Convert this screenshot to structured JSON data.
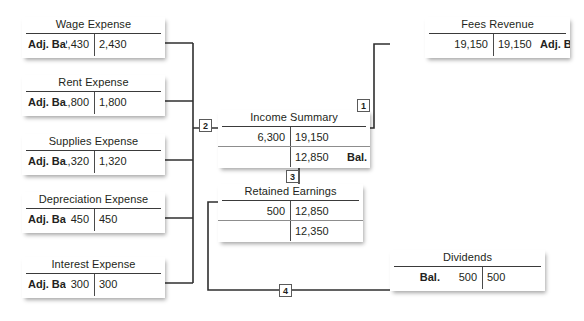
{
  "diagram": {
    "line_color": "#333333",
    "card_bg": "#ffffff"
  },
  "accounts": [
    {
      "key": "wage_expense",
      "name": "Wage Expense",
      "rows": [
        {
          "label_left": "Adj. Bal.",
          "debit": "2,430",
          "credit": "2,430",
          "label_right": ""
        }
      ]
    },
    {
      "key": "rent_expense",
      "name": "Rent Expense",
      "rows": [
        {
          "label_left": "Adj. Bal.",
          "debit": "1,800",
          "credit": "1,800",
          "label_right": ""
        }
      ]
    },
    {
      "key": "supplies_expense",
      "name": "Supplies Expense",
      "rows": [
        {
          "label_left": "Adj. Bal.",
          "debit": "1,320",
          "credit": "1,320",
          "label_right": ""
        }
      ]
    },
    {
      "key": "depreciation_expense",
      "name": "Depreciation Expense",
      "rows": [
        {
          "label_left": "Adj. Bal.",
          "debit": "450",
          "credit": "450",
          "label_right": ""
        }
      ]
    },
    {
      "key": "interest_expense",
      "name": "Interest Expense",
      "rows": [
        {
          "label_left": "Adj. Bal.",
          "debit": "300",
          "credit": "300",
          "label_right": ""
        }
      ]
    },
    {
      "key": "fees_revenue",
      "name": "Fees Revenue",
      "rows": [
        {
          "label_left": "",
          "debit": "19,150",
          "credit": "19,150",
          "label_right": "Adj. Bal."
        }
      ]
    },
    {
      "key": "income_summary",
      "name": "Income Summary",
      "rows": [
        {
          "label_left": "",
          "debit": "6,300",
          "credit": "19,150",
          "label_right": ""
        },
        {
          "label_left": "",
          "debit": "",
          "credit": "12,850",
          "label_right": "Bal."
        }
      ]
    },
    {
      "key": "retained_earnings",
      "name": "Retained Earnings",
      "rows": [
        {
          "label_left": "",
          "debit": "500",
          "credit": "12,850",
          "label_right": ""
        },
        {
          "label_left": "",
          "debit": "",
          "credit": "12,350",
          "label_right": ""
        }
      ]
    },
    {
      "key": "dividends",
      "name": "Dividends",
      "rows": [
        {
          "label_left": "Bal.",
          "debit": "500",
          "credit": "500",
          "label_right": ""
        }
      ]
    }
  ],
  "markers": [
    {
      "id": "1",
      "label": "1"
    },
    {
      "id": "2",
      "label": "2"
    },
    {
      "id": "3",
      "label": "3"
    },
    {
      "id": "4",
      "label": "4"
    }
  ]
}
